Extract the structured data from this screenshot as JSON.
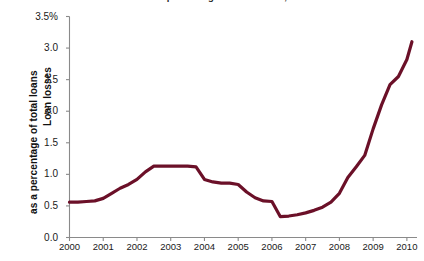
{
  "figure": {
    "title_clipped": "Loan losses as a percentage of total loans, 2000–2010",
    "background": "#ffffff"
  },
  "axis": {
    "y_title_line1": "Loan losses",
    "y_title_line2": "as a percentage of total loans",
    "x_title": ""
  },
  "chart_data": {
    "type": "line",
    "title": "",
    "xlabel": "",
    "ylabel": "Loan losses as a percentage of total loans",
    "xlim": [
      2000,
      2010.3
    ],
    "ylim": [
      0.0,
      3.5
    ],
    "grid": false,
    "legend": null,
    "line_color": "#6B1028",
    "line_width_px": 3.2,
    "y_ticks": [
      0.0,
      0.5,
      1.0,
      1.5,
      2.0,
      2.5,
      3.0,
      3.5
    ],
    "y_tick_labels": [
      "0.0",
      "0.5",
      "1.0",
      "1.5",
      "2.0",
      "2.5",
      "3.0",
      "3.5%"
    ],
    "x_ticks": [
      2000,
      2001,
      2002,
      2003,
      2004,
      2005,
      2006,
      2007,
      2008,
      2009,
      2010
    ],
    "x_tick_labels": [
      "2000",
      "2001",
      "2002",
      "2003",
      "2004",
      "2005",
      "2006",
      "2007",
      "2008",
      "2009",
      "2010"
    ],
    "series": [
      {
        "name": "Loan losses",
        "x": [
          2000.0,
          2000.25,
          2000.5,
          2000.75,
          2001.0,
          2001.25,
          2001.5,
          2001.75,
          2002.0,
          2002.25,
          2002.5,
          2002.75,
          2003.0,
          2003.25,
          2003.5,
          2003.75,
          2004.0,
          2004.25,
          2004.5,
          2004.75,
          2005.0,
          2005.25,
          2005.5,
          2005.75,
          2006.0,
          2006.25,
          2006.5,
          2006.75,
          2007.0,
          2007.25,
          2007.5,
          2007.75,
          2008.0,
          2008.25,
          2008.5,
          2008.75,
          2009.0,
          2009.25,
          2009.5,
          2009.75,
          2010.0,
          2010.15
        ],
        "y": [
          0.56,
          0.56,
          0.57,
          0.58,
          0.62,
          0.7,
          0.78,
          0.84,
          0.92,
          1.04,
          1.13,
          1.13,
          1.13,
          1.13,
          1.13,
          1.12,
          0.92,
          0.88,
          0.86,
          0.86,
          0.84,
          0.72,
          0.63,
          0.58,
          0.57,
          0.33,
          0.34,
          0.36,
          0.39,
          0.43,
          0.48,
          0.56,
          0.7,
          0.95,
          1.12,
          1.3,
          1.72,
          2.1,
          2.42,
          2.55,
          2.82,
          3.1
        ]
      }
    ]
  }
}
